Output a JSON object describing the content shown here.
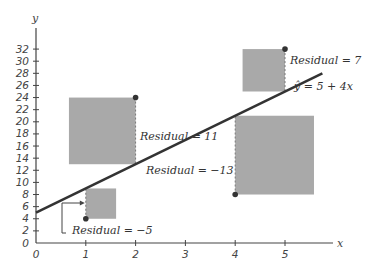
{
  "chart_data": {
    "type": "scatter",
    "title": "",
    "xlabel": "x",
    "ylabel": "y",
    "xlim": [
      0,
      5.8
    ],
    "ylim": [
      0,
      33
    ],
    "x_ticks": [
      0,
      1,
      2,
      3,
      4,
      5
    ],
    "y_ticks": [
      0,
      2,
      4,
      6,
      8,
      10,
      12,
      14,
      16,
      18,
      20,
      22,
      24,
      26,
      28,
      30,
      32
    ],
    "grid": false,
    "points": [
      {
        "x": 1,
        "y": 4,
        "fitted": 9,
        "residual": -5,
        "label": "Residual = −5"
      },
      {
        "x": 2,
        "y": 24,
        "fitted": 13,
        "residual": 11,
        "label": "Residual = 11"
      },
      {
        "x": 4,
        "y": 8,
        "fitted": 21,
        "residual": -13,
        "label": "Residual = −13"
      },
      {
        "x": 5,
        "y": 32,
        "fitted": 25,
        "residual": 7,
        "label": "Residual = 7"
      }
    ],
    "regression_line": {
      "intercept": 5,
      "slope": 4,
      "label": "ŷ = 5 + 4x"
    },
    "annotations": [
      "Residual = 11",
      "Residual = −13",
      "Residual = 7",
      "Residual = −5",
      "ŷ = 5 + 4x"
    ],
    "squares": "gray squares with side = |residual| drawn on each residual segment"
  },
  "colors": {
    "square_fill": "#a9a9a9",
    "line": "#333333",
    "point": "#333333",
    "axis": "#444444"
  }
}
